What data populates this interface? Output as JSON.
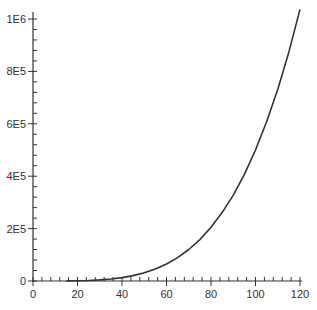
{
  "chart_data": {
    "type": "line",
    "title": "",
    "xlabel": "",
    "ylabel": "",
    "xlim": [
      0,
      120
    ],
    "ylim": [
      0,
      1000000
    ],
    "grid": false,
    "legend": null,
    "x_ticks": [
      0,
      20,
      40,
      60,
      80,
      100,
      120
    ],
    "x_tick_labels": [
      "0",
      "20",
      "40",
      "60",
      "80",
      "100",
      "120"
    ],
    "y_ticks": [
      0,
      200000,
      400000,
      600000,
      800000,
      1000000
    ],
    "y_tick_labels": [
      "0",
      "2E5",
      "4E5",
      "6E5",
      "8E5",
      "1E6"
    ],
    "series": [
      {
        "name": "curve",
        "color": "#333333",
        "x": [
          15,
          20,
          25,
          30,
          35,
          40,
          45,
          50,
          55,
          60,
          65,
          70,
          75,
          80,
          85,
          90,
          95,
          100,
          105,
          110,
          115,
          120
        ],
        "y": [
          253,
          800,
          1953,
          4050,
          7503,
          12800,
          20503,
          31250,
          45753,
          64800,
          89253,
          120050,
          158203,
          204800,
          261003,
          328050,
          407253,
          500000,
          607753,
          732050,
          874503,
          1036800
        ]
      }
    ]
  }
}
